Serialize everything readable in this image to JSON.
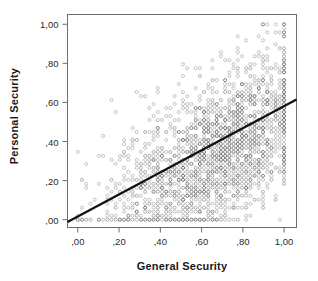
{
  "chart_data": {
    "type": "scatter",
    "title": "",
    "xlabel": "General Security",
    "ylabel": "Personal Security",
    "xlim": [
      -0.05,
      1.06
    ],
    "ylim": [
      -0.04,
      1.05
    ],
    "xticks": [
      0.0,
      0.2,
      0.4,
      0.6,
      0.8,
      1.0
    ],
    "yticks": [
      0.0,
      0.2,
      0.4,
      0.6,
      0.8,
      1.0
    ],
    "xticklabels": [
      ",00",
      ",20",
      ",40",
      ",60",
      ",80",
      "1,00"
    ],
    "yticklabels": [
      ",00",
      ",20",
      ",40",
      ",60",
      ",80",
      "1,00"
    ],
    "grid": false,
    "legend": null,
    "marker": "open-circle",
    "marker_color": "#6b6b6b",
    "marker_size": 3.1,
    "frame_color": "#6e6e6e",
    "background": "#ffffff",
    "fit_line": {
      "type": "linear-regression",
      "x_start": -0.05,
      "y_start": -0.012,
      "x_end": 1.06,
      "y_end": 0.615,
      "slope": 0.565,
      "intercept": 0.016,
      "color": "#111111",
      "width": 2.3
    },
    "series": [
      {
        "name": "observations",
        "n_points": 2100,
        "correlation": 0.55,
        "x_mean": 0.62,
        "y_mean": 0.37,
        "x_sd": 0.23,
        "y_sd": 0.23,
        "lattice_step": 0.0204,
        "note": "Values fall on a discrete lattice (survey index scores); density is highest for x in 0,40-0,90 and y in 0,00-0,60."
      }
    ]
  }
}
